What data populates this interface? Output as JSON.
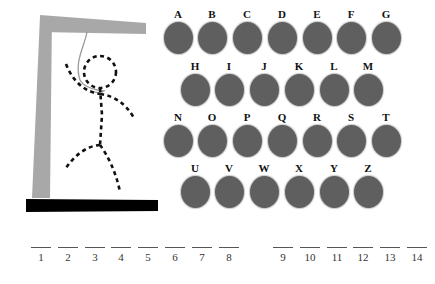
{
  "game": {
    "title": "Hangman",
    "colors": {
      "letter_disc": "#5f5f5f",
      "gallows_post": "#a8a8a8",
      "gallows_base": "#000000",
      "rope": "#9a9a9a",
      "figure": "#111111"
    }
  },
  "gallows": {
    "icon": "gallows-icon",
    "figure_parts": [
      "head",
      "body",
      "left-arm",
      "right-arm",
      "left-leg",
      "right-leg"
    ]
  },
  "letters": [
    {
      "label": "A",
      "x": 163,
      "y": 8
    },
    {
      "label": "B",
      "x": 197,
      "y": 8
    },
    {
      "label": "C",
      "x": 232,
      "y": 8
    },
    {
      "label": "D",
      "x": 267,
      "y": 8
    },
    {
      "label": "E",
      "x": 302,
      "y": 8
    },
    {
      "label": "F",
      "x": 336,
      "y": 8
    },
    {
      "label": "G",
      "x": 371,
      "y": 8
    },
    {
      "label": "H",
      "x": 180,
      "y": 60
    },
    {
      "label": "I",
      "x": 214,
      "y": 60
    },
    {
      "label": "J",
      "x": 249,
      "y": 60
    },
    {
      "label": "K",
      "x": 284,
      "y": 60
    },
    {
      "label": "L",
      "x": 319,
      "y": 60
    },
    {
      "label": "M",
      "x": 353,
      "y": 60
    },
    {
      "label": "N",
      "x": 163,
      "y": 111
    },
    {
      "label": "O",
      "x": 197,
      "y": 111
    },
    {
      "label": "P",
      "x": 232,
      "y": 111
    },
    {
      "label": "Q",
      "x": 267,
      "y": 111
    },
    {
      "label": "R",
      "x": 302,
      "y": 111
    },
    {
      "label": "S",
      "x": 336,
      "y": 111
    },
    {
      "label": "T",
      "x": 371,
      "y": 111
    },
    {
      "label": "U",
      "x": 180,
      "y": 162
    },
    {
      "label": "V",
      "x": 214,
      "y": 162
    },
    {
      "label": "W",
      "x": 249,
      "y": 162
    },
    {
      "label": "X",
      "x": 284,
      "y": 162
    },
    {
      "label": "Y",
      "x": 319,
      "y": 162
    },
    {
      "label": "Z",
      "x": 353,
      "y": 162
    }
  ],
  "word_slots": [
    {
      "num": "1",
      "x": 31
    },
    {
      "num": "2",
      "x": 58
    },
    {
      "num": "3",
      "x": 85
    },
    {
      "num": "4",
      "x": 111
    },
    {
      "num": "5",
      "x": 138
    },
    {
      "num": "6",
      "x": 165
    },
    {
      "num": "7",
      "x": 192
    },
    {
      "num": "8",
      "x": 219
    },
    {
      "num": "9",
      "x": 273
    },
    {
      "num": "10",
      "x": 300
    },
    {
      "num": "11",
      "x": 327
    },
    {
      "num": "12",
      "x": 353
    },
    {
      "num": "13",
      "x": 380
    },
    {
      "num": "14",
      "x": 407
    }
  ],
  "slot_row_y": 247
}
